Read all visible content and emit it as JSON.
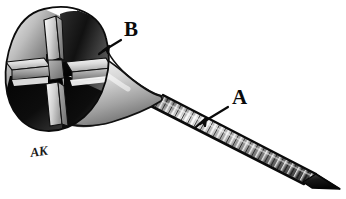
{
  "figure": {
    "background_color": "#ffffff",
    "ink_color": "#0a0a0a",
    "signature": "AK"
  },
  "callouts": [
    {
      "id": "a",
      "label": "A",
      "target": "threaded-shaft",
      "label_x": 232,
      "label_y": 104,
      "arrow_from_x": 228,
      "arrow_from_y": 107,
      "arrow_to_x": 196,
      "arrow_to_y": 127
    },
    {
      "id": "b",
      "label": "B",
      "target": "head-neck-junction",
      "label_x": 124,
      "label_y": 36,
      "arrow_from_x": 122,
      "arrow_from_y": 39,
      "arrow_to_x": 99,
      "arrow_to_y": 54
    }
  ],
  "parts": {
    "head": {
      "name": "cruciform-recess-head",
      "description": "Cross-shaped recessed screw head shown in cutaway",
      "highlight_color": "#f2f2f2",
      "midtone_color": "#9a9a9a",
      "shadow_color": "#111111"
    },
    "neck": {
      "name": "conical-neck",
      "description": "Flared conical neck joining head to shaft",
      "highlight_color": "#fbfbfb",
      "midtone_color": "#b4b4b4",
      "shadow_color": "#5a5a5a"
    },
    "shaft": {
      "name": "threaded-shaft",
      "description": "Helically threaded cylindrical shaft",
      "thread_count": 32,
      "highlight_color": "#ededed",
      "midtone_color": "#8e8e8e",
      "shadow_color": "#1c1c1c"
    },
    "tip": {
      "name": "pointed-tip",
      "description": "Chamfered pointed tip at distal end",
      "color": "#121212"
    }
  },
  "colors": {
    "white": "#ffffff",
    "light_gray": "#e6e6e6",
    "mid_gray": "#909090",
    "dark_gray": "#3a3a3a",
    "black": "#0a0a0a"
  }
}
